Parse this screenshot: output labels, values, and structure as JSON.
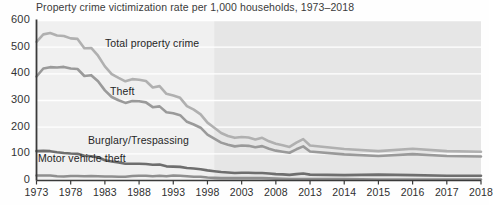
{
  "chart_data": {
    "type": "line",
    "title": "Property crime victimization rate per 1,000 households, 1973–2018",
    "xlabel": "",
    "ylabel": "",
    "ylim": [
      0,
      600
    ],
    "yticks": [
      0,
      100,
      200,
      300,
      400,
      500,
      600
    ],
    "ytick_labels": [
      "0",
      "100",
      "200",
      "300",
      "400",
      "500",
      "600"
    ],
    "xtick_labels": [
      "1973",
      "1978",
      "1983",
      "1988",
      "1993",
      "1998",
      "2003",
      "2008",
      "2013",
      "2014",
      "2015",
      "2016",
      "2017",
      "2018"
    ],
    "grid": "horizontal",
    "legend": "inline-labels",
    "x": [
      1973,
      1974,
      1975,
      1976,
      1977,
      1978,
      1979,
      1980,
      1981,
      1982,
      1983,
      1984,
      1985,
      1986,
      1987,
      1988,
      1989,
      1990,
      1991,
      1992,
      1993,
      1994,
      1995,
      1996,
      1997,
      1998,
      1999,
      2000,
      2001,
      2002,
      2003,
      2004,
      2005,
      2006,
      2007,
      2008,
      2009,
      2010,
      2011,
      2012,
      2013,
      2014,
      2015,
      2016,
      2017,
      2018
    ],
    "series": [
      {
        "name": "Total property crime",
        "color": "#b0b0b0",
        "label_x": 105,
        "label_y": 37,
        "values": [
          520,
          548,
          553,
          544,
          542,
          533,
          531,
          496,
          497,
          468,
          428,
          399,
          385,
          372,
          380,
          378,
          373,
          349,
          354,
          325,
          319,
          310,
          279,
          266,
          248,
          217,
          198,
          178,
          167,
          160,
          163,
          161,
          154,
          160,
          147,
          138,
          132,
          126,
          142,
          155,
          131,
          118,
          110,
          119,
          110,
          108
        ]
      },
      {
        "name": "Theft",
        "color": "#9a9a9a",
        "label_x": 110,
        "label_y": 85,
        "values": [
          390,
          420,
          425,
          424,
          426,
          420,
          418,
          392,
          395,
          372,
          338,
          313,
          301,
          291,
          298,
          297,
          293,
          275,
          278,
          256,
          252,
          245,
          220,
          210,
          198,
          172,
          157,
          142,
          134,
          128,
          131,
          130,
          125,
          129,
          119,
          112,
          108,
          104,
          117,
          128,
          109,
          98,
          92,
          99,
          92,
          90
        ]
      },
      {
        "name": "Burglary/Trespassing",
        "color": "#6e6e6e",
        "label_x": 88,
        "label_y": 134,
        "values": [
          110,
          111,
          110,
          106,
          103,
          101,
          100,
          93,
          91,
          87,
          76,
          71,
          68,
          63,
          63,
          63,
          62,
          59,
          60,
          53,
          52,
          51,
          47,
          45,
          42,
          38,
          35,
          32,
          30,
          28,
          29,
          29,
          28,
          28,
          26,
          24,
          23,
          21,
          24,
          26,
          22,
          20,
          22,
          20,
          18,
          18
        ]
      },
      {
        "name": "Motor vehicle theft",
        "color": "#8f8f8f",
        "label_x": 38,
        "label_y": 152,
        "values": [
          19,
          19,
          19,
          16,
          15,
          17,
          17,
          16,
          17,
          16,
          15,
          15,
          14,
          14,
          17,
          18,
          18,
          16,
          18,
          16,
          19,
          18,
          16,
          14,
          14,
          11,
          10,
          9,
          9,
          9,
          9,
          9,
          9,
          9,
          8,
          7,
          6,
          5,
          5,
          5,
          5,
          5,
          4,
          4,
          4,
          4
        ]
      }
    ],
    "shaded_region": {
      "from": 1999,
      "to": 2018,
      "color": "#e6e6e6"
    },
    "plot_background": "#f0f0f0"
  }
}
